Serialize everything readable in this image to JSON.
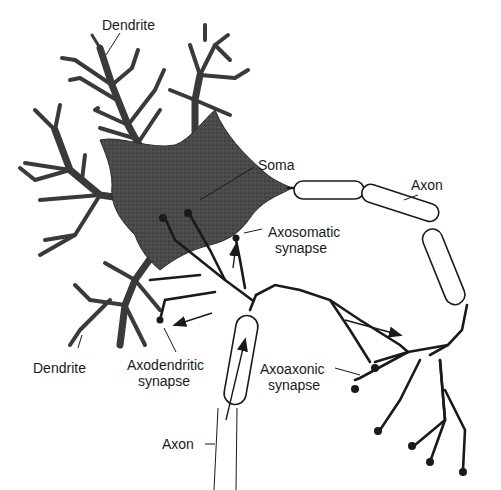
{
  "diagram": {
    "colors": {
      "ink": "#1a1a1a",
      "soma_fill": "#4a4a4a",
      "background": "#ffffff"
    },
    "labels": {
      "dendrite_top": "Dendrite",
      "soma": "Soma",
      "axon_top": "Axon",
      "axosomatic_line1": "Axosomatic",
      "axosomatic_line2": "synapse",
      "dendrite_bottom": "Dendrite",
      "axodendritic_line1": "Axodendritic",
      "axodendritic_line2": "synapse",
      "axoaxonic_line1": "Axoaxonic",
      "axoaxonic_line2": "synapse",
      "axon_bottom": "Axon"
    }
  }
}
